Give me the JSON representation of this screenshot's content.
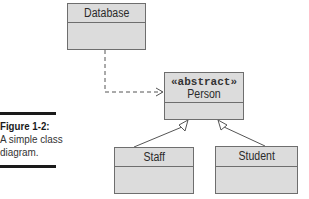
{
  "diagram": {
    "type": "uml-class-diagram",
    "classes": [
      {
        "id": "database",
        "name": "Database",
        "stereotype": null
      },
      {
        "id": "person",
        "name": "Person",
        "stereotype": "«abstract»"
      },
      {
        "id": "staff",
        "name": "Staff",
        "stereotype": null
      },
      {
        "id": "student",
        "name": "Student",
        "stereotype": null
      }
    ],
    "relationships": [
      {
        "from": "database",
        "to": "person",
        "kind": "dependency",
        "style": "dashed",
        "arrow": "open"
      },
      {
        "from": "staff",
        "to": "person",
        "kind": "generalization",
        "style": "solid",
        "arrow": "hollow-triangle"
      },
      {
        "from": "student",
        "to": "person",
        "kind": "generalization",
        "style": "solid",
        "arrow": "hollow-triangle"
      }
    ]
  },
  "caption": {
    "label": "Figure 1-2:",
    "text": "A simple class diagram."
  },
  "colors": {
    "box_fill": "#dcdcdc",
    "box_border": "#6e6e6e",
    "line": "#555555",
    "text": "#2a2a2a"
  }
}
